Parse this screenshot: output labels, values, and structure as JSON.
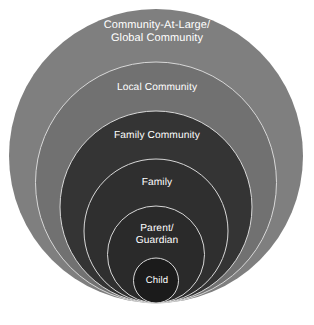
{
  "diagram": {
    "type": "nested-circles",
    "background_color": "#ffffff",
    "canvas": {
      "width": 314,
      "height": 325
    },
    "stroke_color": "#d8d8d8",
    "label_color": "#ffffff",
    "rings": [
      {
        "id": "community-at-large",
        "label": "Community-At-Large/\nGlobal Community",
        "level": 1,
        "fill": "#7f7f7f",
        "cx": 156,
        "cy": 156,
        "r": 147,
        "top": 9,
        "bottom": 303,
        "diameter": 294
      },
      {
        "id": "local-community",
        "label": "Local Community",
        "level": 2,
        "fill": "#717171",
        "cx": 156,
        "cy": 182.5,
        "r": 120.5,
        "top": 62,
        "bottom": 303,
        "diameter": 241
      },
      {
        "id": "family-community",
        "label": "Family Community",
        "level": 3,
        "fill": "#343434",
        "cx": 156,
        "cy": 207,
        "r": 96,
        "top": 111,
        "bottom": 303,
        "diameter": 192
      },
      {
        "id": "family",
        "label": "Family",
        "level": 4,
        "fill": "#2f2f2f",
        "cx": 156,
        "cy": 231,
        "r": 72,
        "top": 159,
        "bottom": 303,
        "diameter": 144
      },
      {
        "id": "parent-guardian",
        "label": "Parent/\nGuardian",
        "level": 5,
        "fill": "#2a2a2a",
        "cx": 156,
        "cy": 254.5,
        "r": 48.5,
        "top": 206,
        "bottom": 303,
        "diameter": 97
      },
      {
        "id": "child",
        "label": "Child",
        "level": 6,
        "fill": "#1b1b1b",
        "cx": 156,
        "cy": 280.5,
        "r": 22.5,
        "top": 258,
        "bottom": 303,
        "diameter": 45
      }
    ]
  }
}
